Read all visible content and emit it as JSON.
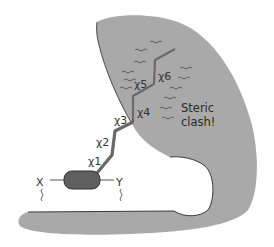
{
  "diagram": {
    "colors": {
      "protein_fill": "#a9a9a9",
      "protein_edge": "#4a4a4a",
      "chain": "#6a6a6a",
      "backbone_unit": "#5f5f5f",
      "background": "#ffffff"
    },
    "torsion_labels": [
      "χ1",
      "χ2",
      "χ3",
      "χ4",
      "χ5",
      "χ6"
    ],
    "annotation": {
      "line1": "Steric",
      "line2": "clash!"
    },
    "backbone_labels": {
      "left": "X",
      "right": "Y"
    }
  }
}
